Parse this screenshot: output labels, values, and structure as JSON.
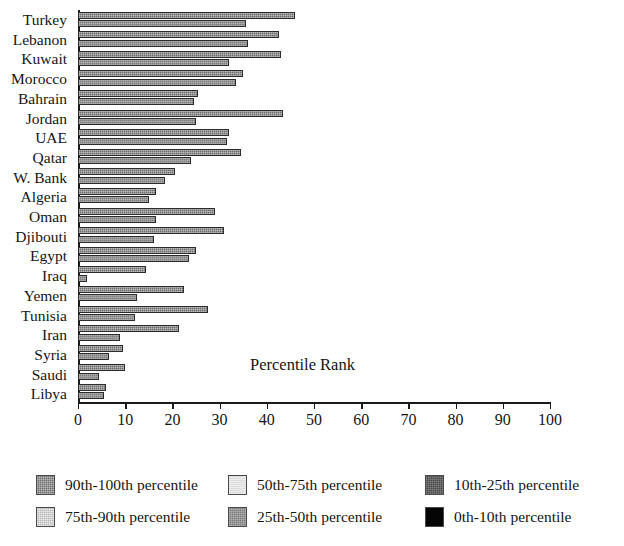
{
  "chart_data": {
    "type": "bar",
    "title": "Percentile Rank",
    "xlabel": "",
    "ylabel": "",
    "xlim": [
      0,
      100
    ],
    "grid": false,
    "orientation": "horizontal",
    "legend_position": "bottom",
    "categories": [
      "Turkey",
      "Lebanon",
      "Kuwait",
      "Morocco",
      "Bahrain",
      "Jordan",
      "UAE",
      "Qatar",
      "W. Bank",
      "Algeria",
      "Oman",
      "Djibouti",
      "Egypt",
      "Iraq",
      "Yemen",
      "Tunisia",
      "Iran",
      "Syria",
      "Saudi",
      "Libya"
    ],
    "x_ticks": [
      0,
      10,
      20,
      30,
      40,
      50,
      60,
      70,
      80,
      90,
      100
    ],
    "series": [
      {
        "name": "bar-1",
        "values": [
          46.0,
          42.5,
          43.0,
          35.0,
          25.5,
          43.5,
          32.0,
          34.5,
          20.5,
          16.5,
          29.0,
          31.0,
          25.0,
          14.5,
          22.5,
          27.5,
          21.5,
          9.5,
          10.0,
          6.0
        ]
      },
      {
        "name": "bar-2",
        "values": [
          35.5,
          36.0,
          32.0,
          33.5,
          24.5,
          25.0,
          31.5,
          24.0,
          18.5,
          15.0,
          16.5,
          16.0,
          23.5,
          2.0,
          12.5,
          12.0,
          9.0,
          6.5,
          4.5,
          5.5
        ]
      }
    ]
  },
  "legend": {
    "items": [
      {
        "label": "90th-100th percentile",
        "swatch": "fill-p90",
        "color": "#6e6e6e"
      },
      {
        "label": "75th-90th percentile",
        "swatch": "fill-p75",
        "color": "#b8b8b8"
      },
      {
        "label": "50th-75th percentile",
        "swatch": "fill-p50",
        "color": "#dcdcdc"
      },
      {
        "label": "25th-50th percentile",
        "swatch": "fill-p25",
        "color": "#7d7d7d"
      },
      {
        "label": "10th-25th percentile",
        "swatch": "fill-p10",
        "color": "#4a4a4a"
      },
      {
        "label": "0th-10th percentile",
        "swatch": "fill-p0",
        "color": "#050505"
      }
    ]
  }
}
